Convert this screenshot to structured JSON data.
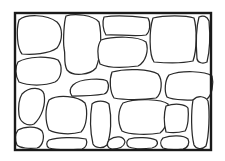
{
  "diagram": {
    "title": "",
    "description_visible": "",
    "colors": {
      "background": "#ffffff",
      "frame": "#1a1a1a",
      "stone_outline": "#2a2a2a",
      "stone_fill": "#ffffff"
    },
    "frame": {
      "x": 15,
      "y": 13,
      "width": 86,
      "height": 58
    },
    "stones": [
      {
        "id": "s1",
        "d": "M19,20 C26,14 46,14 57,22 C63,28 63,40 57,48 C49,54 32,55 22,54 C17,48 16,30 19,20 Z"
      },
      {
        "id": "s2",
        "d": "M66,16 C75,13 93,15 99,22 C102,34 101,56 96,68 C90,75 73,77 67,70 C63,62 66,56 64,48 C63,40 64,22 66,16 Z"
      },
      {
        "id": "s3",
        "d": "M104,17 C115,15 133,16 148,18 C151,23 150,32 146,35 C134,37 116,34 106,35 C103,30 102,22 104,17 Z"
      },
      {
        "id": "s4",
        "d": "M101,40 C114,36 138,36 146,42 C149,50 146,62 138,66 C124,68 108,68 100,64 C97,56 97,46 101,40 Z"
      },
      {
        "id": "s5",
        "d": "M153,18 C164,15 186,15 194,18 C197,28 197,50 193,61 C184,63 166,63 154,62 C149,55 149,30 153,18 Z"
      },
      {
        "id": "s6",
        "d": "M199,17 C203,15 207,16 209,21 C210,32 210,50 207,62 C203,64 198,63 197,59 C196,46 196,28 199,17 Z"
      },
      {
        "id": "s7",
        "d": "M18,62 C28,56 48,56 58,60 C63,66 62,78 55,82 C45,86 28,86 19,82 C15,75 15,67 18,62 Z"
      },
      {
        "id": "s8",
        "d": "M73,85 C80,78 103,78 107,81 C110,86 108,93 104,94 C93,96 80,96 72,96 C69,92 70,88 73,85 Z"
      },
      {
        "id": "s9",
        "d": "M112,72 C126,68 150,69 158,74 C163,80 162,94 156,98 C143,100 124,100 114,98 C110,92 109,80 112,72 Z"
      },
      {
        "id": "s10",
        "d": "M169,75 C182,70 205,71 212,76 C214,84 212,95 207,99 C193,101 172,100 167,97 C164,91 165,80 169,75 Z"
      },
      {
        "id": "s11",
        "d": "M22,94 C30,86 42,87 44,94 C46,104 42,117 34,124 C27,127 20,122 19,115 C18,106 19,99 22,94 Z"
      },
      {
        "id": "s12",
        "d": "M49,100 C58,94 78,96 85,103 C88,111 87,126 81,132 C71,135 56,134 49,130 C45,122 45,108 49,100 Z"
      },
      {
        "id": "s13",
        "d": "M92,104 C96,100 105,100 109,104 C112,118 111,135 107,145 C103,149 95,148 93,144 C90,131 90,116 92,104 Z"
      },
      {
        "id": "s14",
        "d": "M123,103 C136,98 162,99 168,104 C170,113 167,128 160,133 C149,135 129,135 122,131 C117,122 118,110 123,103 Z"
      },
      {
        "id": "s15",
        "d": "M18,130 C25,126 37,126 42,131 C45,137 43,146 37,148 C29,149 20,148 17,145 C15,140 15,134 18,130 Z"
      },
      {
        "id": "s16",
        "d": "M49,140 C58,137 75,137 86,139 C88,143 86,148 82,149 C70,150 56,150 49,148 C46,146 46,142 49,140 Z"
      },
      {
        "id": "s17",
        "d": "M129,139 C136,137 150,137 156,140 C159,143 157,147 152,148 C144,149 134,149 129,147 C126,145 126,141 129,139 Z"
      },
      {
        "id": "s18",
        "d": "M166,106 C175,103 185,104 188,108 C189,116 188,127 185,131 C178,133 171,133 166,132 C164,124 164,113 166,106 Z"
      },
      {
        "id": "s19",
        "d": "M193,100 C198,95 205,96 208,101 C210,112 209,136 206,146 C202,150 196,149 194,145 C191,133 191,112 193,100 Z"
      },
      {
        "id": "s20",
        "d": "M163,138 C171,135 184,135 188,139 C190,143 188,148 183,149 C176,150 168,150 163,148 C160,145 160,141 163,138 Z"
      },
      {
        "id": "s21",
        "d": "M109,140 C116,135 124,136 125,142 C124,147 118,149 112,149 C107,148 106,144 109,140 Z"
      }
    ]
  }
}
